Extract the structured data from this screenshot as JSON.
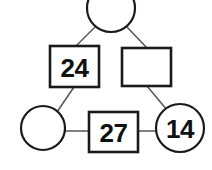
{
  "diagram": {
    "type": "node-link-puzzle",
    "canvas": {
      "width": 212,
      "height": 170
    },
    "background_color": "#ffffff",
    "stroke_color": "#1a1a1a",
    "edge_color": "#555555",
    "label_color": "#111111",
    "nodes": [
      {
        "id": "top-circle",
        "shape": "circle",
        "label": "",
        "empty": true,
        "cx": 111,
        "cy": 8,
        "r": 24,
        "clipped_top": true
      },
      {
        "id": "left-square",
        "shape": "square",
        "label": "24",
        "empty": false,
        "x": 50,
        "y": 46,
        "width": 49,
        "height": 41
      },
      {
        "id": "right-square",
        "shape": "square",
        "label": "",
        "empty": true,
        "x": 122,
        "y": 48,
        "width": 49,
        "height": 38
      },
      {
        "id": "bottom-left-circle",
        "shape": "circle",
        "label": "",
        "empty": true,
        "cx": 43,
        "cy": 128,
        "r": 22
      },
      {
        "id": "bottom-square",
        "shape": "square",
        "label": "27",
        "empty": false,
        "x": 89,
        "y": 112,
        "width": 49,
        "height": 40
      },
      {
        "id": "bottom-right-circle",
        "shape": "circle",
        "label": "14",
        "empty": false,
        "cx": 180,
        "cy": 128,
        "r": 24
      }
    ],
    "edges": [
      {
        "id": "edge-top-to-left",
        "from": "top-circle",
        "to": "left-square",
        "x1": 96,
        "y1": 26,
        "x2": 76,
        "y2": 46
      },
      {
        "id": "edge-top-to-right",
        "from": "top-circle",
        "to": "right-square",
        "x1": 126,
        "y1": 26,
        "x2": 147,
        "y2": 48
      },
      {
        "id": "edge-left-to-bottomleft",
        "from": "left-square",
        "to": "bottom-left-circle",
        "x1": 74,
        "y1": 87,
        "x2": 57,
        "y2": 112
      },
      {
        "id": "edge-right-to-bottomright",
        "from": "right-square",
        "to": "bottom-right-circle",
        "x1": 147,
        "y1": 86,
        "x2": 167,
        "y2": 110
      },
      {
        "id": "edge-bottomleft-to-bottom",
        "from": "bottom-left-circle",
        "to": "bottom-square",
        "x1": 65,
        "y1": 131,
        "x2": 89,
        "y2": 131
      },
      {
        "id": "edge-bottom-to-bottomright",
        "from": "bottom-square",
        "to": "bottom-right-circle",
        "x1": 138,
        "y1": 131,
        "x2": 157,
        "y2": 131
      }
    ],
    "values": {
      "left_square_value": "24",
      "bottom_square_value": "27",
      "bottom_right_circle_value": "14"
    }
  }
}
